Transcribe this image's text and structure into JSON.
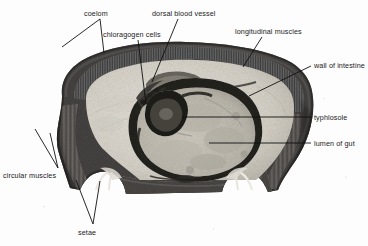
{
  "figure": {
    "background_color": "#fdfdfd",
    "ink_color": "#1b1b1b",
    "width": 368,
    "height": 246
  },
  "specimen": {
    "organism": "earthworm",
    "section_type": "transverse section",
    "stain_tone": "grayscale",
    "palette": {
      "cuticle_dark": "#3a3a3a",
      "longitudinal_muscle": "#5c5c5c",
      "circular_muscle": "#4a4a4a",
      "coelom_pale": "#dcd8cf",
      "gut_wall_dark": "#2e2e2e",
      "gut_lumen": "#c9c5bb",
      "typhlosole_dark": "#303030",
      "chloragogen": "#6e6a62"
    }
  },
  "labels": [
    {
      "id": "coelom",
      "text": "coelom",
      "x": 84,
      "y": 10
    },
    {
      "id": "chloragogen-cells",
      "text": "chloragogen cells",
      "x": 103,
      "y": 31
    },
    {
      "id": "dorsal-blood-vessel",
      "text": "dorsal blood vessel",
      "x": 152,
      "y": 10
    },
    {
      "id": "longitudinal-muscles",
      "text": "longitudinal muscles",
      "x": 235,
      "y": 28
    },
    {
      "id": "wall-of-intestine",
      "text": "wall of intestine",
      "x": 314,
      "y": 62
    },
    {
      "id": "typhlosole",
      "text": "typhlosole",
      "x": 314,
      "y": 114
    },
    {
      "id": "lumen-of-gut",
      "text": "lumen of gut",
      "x": 314,
      "y": 140
    },
    {
      "id": "circular-muscles",
      "text": "circular muscles",
      "x": 3,
      "y": 172
    },
    {
      "id": "setae",
      "text": "setae",
      "x": 78,
      "y": 229
    }
  ],
  "leader_lines": [
    {
      "id": "leader-coelom",
      "points": "100,19 104,53"
    },
    {
      "id": "leader-coelom-inner",
      "points": "100,19 62,47"
    },
    {
      "id": "leader-chloragogen",
      "points": "138,40 146,104"
    },
    {
      "id": "leader-dorsal-blood-vessel",
      "points": "178,19 152,82"
    },
    {
      "id": "leader-longitudinal-muscles",
      "points": "262,37 243,67"
    },
    {
      "id": "leader-wall-of-intestine",
      "points": "311,66 249,96"
    },
    {
      "id": "leader-typhlosole",
      "points": "311,117 182,117"
    },
    {
      "id": "leader-lumen-of-gut",
      "points": "311,143 209,143"
    },
    {
      "id": "leader-circular-1",
      "points": "58,168 35,129"
    },
    {
      "id": "leader-circular-2",
      "points": "58,168 50,133"
    },
    {
      "id": "leader-setae-1",
      "points": "93,224 76,180"
    },
    {
      "id": "leader-setae-2",
      "points": "93,224 100,181"
    }
  ]
}
